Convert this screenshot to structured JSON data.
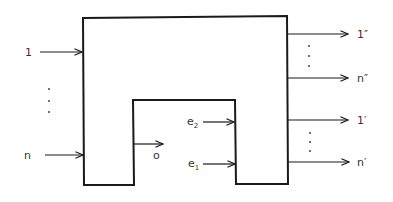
{
  "diagram": {
    "colors": {
      "stroke": "#1a1a1a",
      "text": "#333333",
      "background": "#ffffff"
    },
    "block": {
      "name": "inverted-U block"
    },
    "inputs_left": [
      {
        "label": "1"
      },
      {
        "label": "n"
      }
    ],
    "inputs_left_ellipsis": "⋮",
    "inner_output": {
      "label": "o"
    },
    "inner_inputs": [
      {
        "label": "e",
        "sub": "2"
      },
      {
        "label": "e",
        "sub": "1"
      }
    ],
    "outputs_right": [
      {
        "label": "1″"
      },
      {
        "label": "n″"
      },
      {
        "label": "1′"
      },
      {
        "label": "n′"
      }
    ]
  }
}
